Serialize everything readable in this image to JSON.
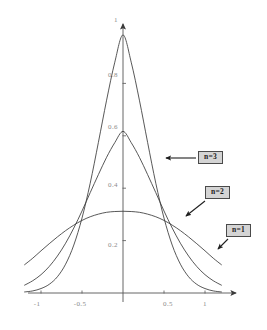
{
  "chart_data": {
    "type": "line",
    "title": "",
    "subtitle": "",
    "xlabel": "",
    "ylabel": "",
    "xlim": [
      -1.2,
      1.3
    ],
    "ylim": [
      -0.02,
      1.06
    ],
    "grid": false,
    "legend_position": "inline-callouts",
    "x_ticks": [
      {
        "value": -1,
        "label": "-1"
      },
      {
        "value": -0.5,
        "label": "-0.5"
      },
      {
        "value": 0.5,
        "label": "0.5"
      },
      {
        "value": 1,
        "label": "1"
      }
    ],
    "y_ticks": [
      {
        "value": 0.2,
        "label": "0.2"
      },
      {
        "value": 0.4,
        "label": "0.4"
      },
      {
        "value": 0.6,
        "label": "0.6"
      },
      {
        "value": 0.8,
        "label": "0.8"
      },
      {
        "value": 1.0,
        "label": "1"
      }
    ],
    "axis_color": "#555555",
    "curve_color": "#3a3a3a",
    "series": [
      {
        "name": "n = 1",
        "label": "n=1",
        "peak_value": 0.31,
        "x": [
          -1.2,
          -1.1,
          -1.0,
          -0.9,
          -0.8,
          -0.7,
          -0.6,
          -0.5,
          -0.4,
          -0.3,
          -0.2,
          -0.1,
          0.0,
          0.1,
          0.2,
          0.3,
          0.4,
          0.5,
          0.6,
          0.7,
          0.8,
          0.9,
          1.0,
          1.1,
          1.2
        ],
        "values": [
          0.108,
          0.133,
          0.161,
          0.188,
          0.214,
          0.238,
          0.259,
          0.277,
          0.291,
          0.301,
          0.308,
          0.311,
          0.312,
          0.311,
          0.308,
          0.301,
          0.291,
          0.277,
          0.259,
          0.238,
          0.214,
          0.188,
          0.161,
          0.133,
          0.108
        ]
      },
      {
        "name": "n = 2",
        "label": "n=2",
        "peak_value": 0.63,
        "x": [
          -1.2,
          -1.1,
          -1.0,
          -0.9,
          -0.8,
          -0.7,
          -0.6,
          -0.5,
          -0.4,
          -0.3,
          -0.2,
          -0.1,
          0.0,
          0.1,
          0.2,
          0.3,
          0.4,
          0.5,
          0.6,
          0.7,
          0.8,
          0.9,
          1.0,
          1.1,
          1.2
        ],
        "values": [
          0.03,
          0.047,
          0.07,
          0.101,
          0.141,
          0.19,
          0.248,
          0.313,
          0.383,
          0.452,
          0.518,
          0.574,
          0.617,
          0.574,
          0.518,
          0.452,
          0.383,
          0.313,
          0.248,
          0.19,
          0.141,
          0.101,
          0.07,
          0.047,
          0.03
        ]
      },
      {
        "name": "n = 3",
        "label": "n=3",
        "peak_value": 1.0,
        "x": [
          -1.2,
          -1.1,
          -1.0,
          -0.9,
          -0.8,
          -0.7,
          -0.6,
          -0.5,
          -0.4,
          -0.3,
          -0.2,
          -0.1,
          0.0,
          0.1,
          0.2,
          0.3,
          0.4,
          0.5,
          0.6,
          0.7,
          0.8,
          0.9,
          1.0,
          1.1,
          1.2
        ],
        "values": [
          0.004,
          0.008,
          0.017,
          0.033,
          0.062,
          0.11,
          0.183,
          0.286,
          0.419,
          0.575,
          0.736,
          0.881,
          0.985,
          0.881,
          0.736,
          0.575,
          0.419,
          0.286,
          0.183,
          0.11,
          0.062,
          0.033,
          0.017,
          0.008,
          0.004
        ]
      }
    ],
    "annotations": [
      {
        "text": "n=3",
        "points_to_series": "n = 3",
        "arrow_direction": "left"
      },
      {
        "text": "n=2",
        "points_to_series": "n = 2",
        "arrow_direction": "down-left"
      },
      {
        "text": "n=1",
        "points_to_series": "n = 1",
        "arrow_direction": "down-left"
      }
    ]
  }
}
